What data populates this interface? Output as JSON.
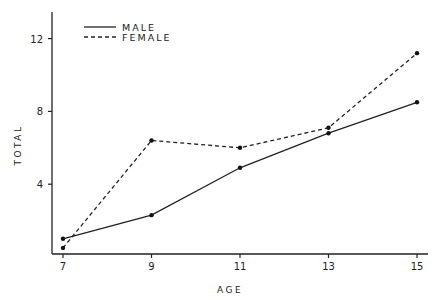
{
  "chart_data": {
    "type": "line",
    "title": "",
    "xlabel": "AGE",
    "ylabel": "TOTAL",
    "x": [
      7,
      9,
      11,
      13,
      15
    ],
    "xticks": [
      "7",
      "9",
      "11",
      "13",
      "15"
    ],
    "yticks": [
      "4",
      "8",
      "12"
    ],
    "ylim": [
      0,
      13.5
    ],
    "xlim": [
      6.8,
      15.25
    ],
    "grid": false,
    "legend_position": "upper-left",
    "series": [
      {
        "name": "MALE",
        "style": "solid",
        "values": [
          1.0,
          2.3,
          4.9,
          6.8,
          8.5
        ]
      },
      {
        "name": "FEMALE",
        "style": "dashed",
        "values": [
          0.5,
          6.4,
          6.0,
          7.1,
          11.2
        ]
      }
    ]
  },
  "colors": {
    "line": "#222222",
    "background": "#ffffff"
  }
}
